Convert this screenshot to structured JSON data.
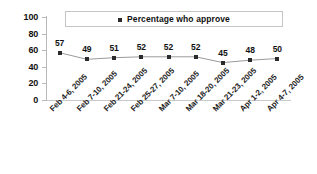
{
  "chart_data": {
    "type": "line",
    "title": "",
    "xlabel": "",
    "ylabel": "",
    "ylim": [
      0,
      100
    ],
    "yticks": [
      0,
      20,
      40,
      60,
      80,
      100
    ],
    "grid": false,
    "legend_position": "top-center",
    "legend": [
      "Percentage who approve"
    ],
    "categories": [
      "Feb 4-6, 2005",
      "Feb 7-10, 2005",
      "Feb 21-24, 2005",
      "Feb 25-27, 2005",
      "Mar 7-10, 2005",
      "Mar 18-20, 2005",
      "Mar 21-23, 2005",
      "Apr 1-2, 2005",
      "Apr 4-7, 2005"
    ],
    "series": [
      {
        "name": "Percentage who approve",
        "values": [
          57,
          49,
          51,
          52,
          52,
          52,
          45,
          48,
          50
        ],
        "color": "#2b2b2b",
        "marker": "square",
        "show_labels": true
      }
    ]
  },
  "legend": {
    "label": "Percentage who approve",
    "marker_name": "legend-square-marker"
  },
  "axis": {
    "y_tick_labels": [
      "100",
      "80",
      "60",
      "40",
      "20",
      "0"
    ]
  },
  "colors": {
    "marker": "#2b2b2b",
    "line": "#9a9a9a",
    "axis": "#b9b9b9",
    "text": "#111111",
    "background": "#ffffff"
  }
}
